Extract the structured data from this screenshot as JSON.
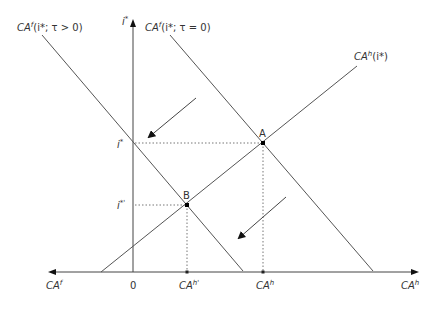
{
  "diagram": {
    "type": "economics-equilibrium-diagram",
    "colors": {
      "line": "#555555",
      "axis": "#444444",
      "dotted": "#777777",
      "text": "#333333",
      "point": "#000000"
    },
    "axes": {
      "vertical_label_base": "i",
      "vertical_label_sup": "*",
      "left_label_base": "CA",
      "left_label_sup": "f",
      "right_label_base": "CA",
      "right_label_sup": "h",
      "origin_label": "0"
    },
    "curves": {
      "foreign_tax": {
        "label": "CAf(i*; τ > 0)",
        "base": "CA",
        "sup": "f",
        "args": "(i*; τ > 0)"
      },
      "foreign_notax": {
        "label": "CAf(i*; τ = 0)",
        "base": "CA",
        "sup": "f",
        "args": "(i*; τ = 0)"
      },
      "home": {
        "label": "CAh(i*)",
        "base": "CA",
        "sup": "h",
        "args": "(i*)"
      }
    },
    "points": {
      "A": {
        "label": "A"
      },
      "B": {
        "label": "B"
      }
    },
    "ticks": {
      "y_high": {
        "base": "i",
        "sup": "*"
      },
      "y_low": {
        "base": "i",
        "sup": "*'"
      },
      "x_low": {
        "base": "CA",
        "sup": "h'"
      },
      "x_high": {
        "base": "CA",
        "sup": "h"
      }
    }
  }
}
